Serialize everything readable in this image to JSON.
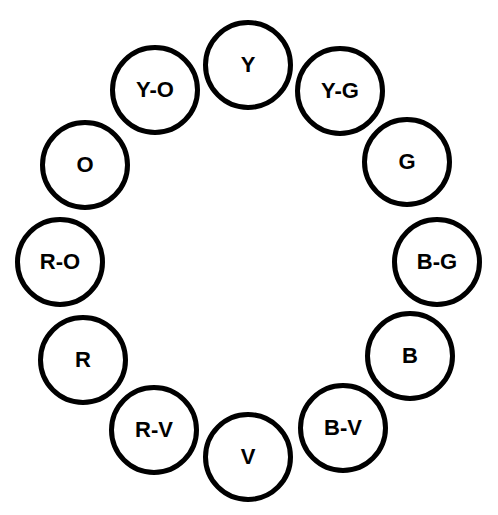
{
  "diagram": {
    "type": "color-wheel",
    "stroke_color": "#000000",
    "fill_color": "#ffffff",
    "nodes": [
      {
        "label": "Y",
        "cx": 248,
        "cy": 65
      },
      {
        "label": "Y-G",
        "cx": 340,
        "cy": 91
      },
      {
        "label": "G",
        "cx": 407,
        "cy": 162
      },
      {
        "label": "B-G",
        "cx": 437,
        "cy": 262
      },
      {
        "label": "B",
        "cx": 410,
        "cy": 356
      },
      {
        "label": "B-V",
        "cx": 343,
        "cy": 428
      },
      {
        "label": "V",
        "cx": 248,
        "cy": 457
      },
      {
        "label": "R-V",
        "cx": 154,
        "cy": 430
      },
      {
        "label": "R",
        "cx": 83,
        "cy": 360
      },
      {
        "label": "R-O",
        "cx": 60,
        "cy": 262
      },
      {
        "label": "O",
        "cx": 85,
        "cy": 165
      },
      {
        "label": "Y-O",
        "cx": 155,
        "cy": 90
      }
    ]
  }
}
